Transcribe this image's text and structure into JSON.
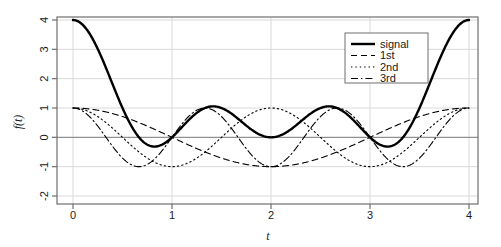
{
  "chart_data": {
    "type": "line",
    "title": "",
    "xlabel": "t",
    "ylabel": "f(t)",
    "xlim": [
      0,
      4
    ],
    "ylim": [
      -2,
      4
    ],
    "xticks": [
      "0",
      "1",
      "2",
      "3",
      "4"
    ],
    "xtick_values": [
      0,
      1,
      2,
      3,
      4
    ],
    "yticks": [
      "4",
      "3",
      "2",
      "1",
      "0",
      "-1",
      "-2"
    ],
    "ytick_values": [
      4,
      3,
      2,
      1,
      0,
      -1,
      -2
    ],
    "grid": true,
    "grid_color": "#d9d9d9",
    "zero_line_color": "#808080",
    "frame_color": "#6e6e6e",
    "background": "#ffffff",
    "legend": {
      "position": "top-right",
      "entries": [
        {
          "label": "signal",
          "style": "solid",
          "width": 2.4,
          "color": "#000000"
        },
        {
          "label": "1st",
          "style": "dashed",
          "width": 1.1,
          "color": "#000000"
        },
        {
          "label": "2nd",
          "style": "dotted",
          "width": 1.1,
          "color": "#000000"
        },
        {
          "label": "3rd",
          "style": "dashdot",
          "width": 1.1,
          "color": "#000000"
        }
      ]
    },
    "series": [
      {
        "name": "signal",
        "formula": "1 + cos(pi*t/2) + cos(pi*t) + cos(3*pi*t/2)",
        "style": "solid",
        "keypoints": [
          {
            "t": 0.0,
            "y": 4.0
          },
          {
            "t": 0.8,
            "y": -0.3
          },
          {
            "t": 1.0,
            "y": 0.0
          },
          {
            "t": 1.4,
            "y": 1.05
          },
          {
            "t": 2.0,
            "y": 0.0
          },
          {
            "t": 2.6,
            "y": 1.05
          },
          {
            "t": 3.0,
            "y": 0.0
          },
          {
            "t": 3.2,
            "y": -0.3
          },
          {
            "t": 4.0,
            "y": 4.0
          }
        ]
      },
      {
        "name": "1st",
        "formula": "cos(pi*t/2)",
        "style": "dashed",
        "keypoints": [
          {
            "t": 0.0,
            "y": 1.0
          },
          {
            "t": 1.0,
            "y": 0.0
          },
          {
            "t": 2.0,
            "y": -1.0
          },
          {
            "t": 3.0,
            "y": 0.0
          },
          {
            "t": 4.0,
            "y": 1.0
          }
        ]
      },
      {
        "name": "2nd",
        "formula": "cos(pi*t)",
        "style": "dotted",
        "keypoints": [
          {
            "t": 0.0,
            "y": 1.0
          },
          {
            "t": 0.5,
            "y": 0.0
          },
          {
            "t": 1.0,
            "y": -1.0
          },
          {
            "t": 1.5,
            "y": 0.0
          },
          {
            "t": 2.0,
            "y": 1.0
          },
          {
            "t": 2.5,
            "y": 0.0
          },
          {
            "t": 3.0,
            "y": -1.0
          },
          {
            "t": 3.5,
            "y": 0.0
          },
          {
            "t": 4.0,
            "y": 1.0
          }
        ]
      },
      {
        "name": "3rd",
        "formula": "cos(3*pi*t/2)",
        "style": "dashdot",
        "keypoints": [
          {
            "t": 0.0,
            "y": 1.0
          },
          {
            "t": 0.333,
            "y": 0.0
          },
          {
            "t": 0.667,
            "y": -1.0
          },
          {
            "t": 1.0,
            "y": 0.0
          },
          {
            "t": 1.333,
            "y": 1.0
          },
          {
            "t": 2.0,
            "y": -1.0
          },
          {
            "t": 2.667,
            "y": 1.0
          },
          {
            "t": 3.333,
            "y": -1.0
          },
          {
            "t": 4.0,
            "y": 1.0
          }
        ]
      }
    ]
  }
}
